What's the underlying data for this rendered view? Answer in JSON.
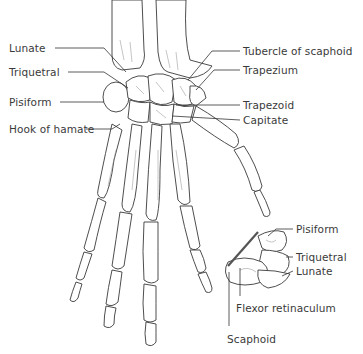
{
  "diagram": {
    "labels_left": [
      {
        "id": "lunate",
        "text": "Lunate",
        "x": 9,
        "y": 42
      },
      {
        "id": "triquetral",
        "text": "Triquetral",
        "x": 9,
        "y": 66
      },
      {
        "id": "pisiform",
        "text": "Pisiform",
        "x": 9,
        "y": 96
      },
      {
        "id": "hook-of-hamate",
        "text": "Hook of hamate",
        "x": 9,
        "y": 123
      }
    ],
    "labels_right": [
      {
        "id": "tubercle-of-scaphoid",
        "text": "Tubercle of scaphoid",
        "x": 243,
        "y": 46
      },
      {
        "id": "trapezium",
        "text": "Trapezium",
        "x": 243,
        "y": 65
      },
      {
        "id": "trapezoid",
        "text": "Trapezoid",
        "x": 243,
        "y": 100
      },
      {
        "id": "capitate",
        "text": "Capitate",
        "x": 243,
        "y": 115
      }
    ],
    "labels_inset": [
      {
        "id": "inset-pisiform",
        "text": "Pisiform",
        "x": 296,
        "y": 224
      },
      {
        "id": "inset-triquetral",
        "text": "Triquetral",
        "x": 296,
        "y": 252
      },
      {
        "id": "inset-lunate",
        "text": "Lunate",
        "x": 296,
        "y": 266
      },
      {
        "id": "flexor-retinaculum",
        "text": "Flexor retinaculum",
        "x": 236,
        "y": 303
      },
      {
        "id": "scaphoid",
        "text": "Scaphoid",
        "x": 227,
        "y": 334
      }
    ],
    "colors": {
      "line": "#3a3a3a",
      "text": "#3a3a3a",
      "background": "#ffffff"
    }
  }
}
